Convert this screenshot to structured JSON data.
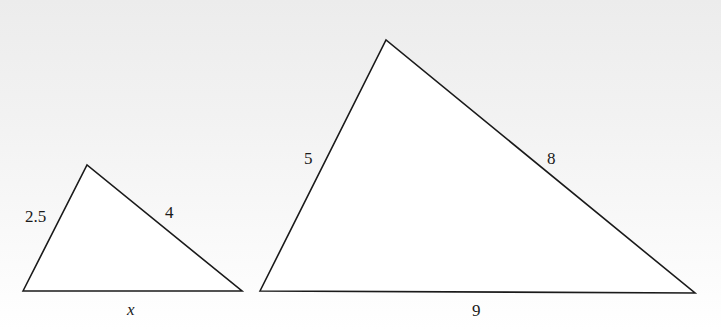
{
  "diagram": {
    "type": "similar-triangles",
    "stroke_color": "#1a1a1a",
    "small_triangle": {
      "vertices": {
        "left": [
          23,
          291
        ],
        "top": [
          87,
          165
        ],
        "right": [
          242,
          291
        ]
      },
      "labels": {
        "left_side": "2.5",
        "right_side": "4",
        "base": "x"
      }
    },
    "large_triangle": {
      "vertices": {
        "left": [
          260,
          291
        ],
        "top": [
          386,
          40
        ],
        "right": [
          695,
          293
        ]
      },
      "labels": {
        "left_side": "5",
        "right_side": "8",
        "base": "9"
      }
    }
  }
}
